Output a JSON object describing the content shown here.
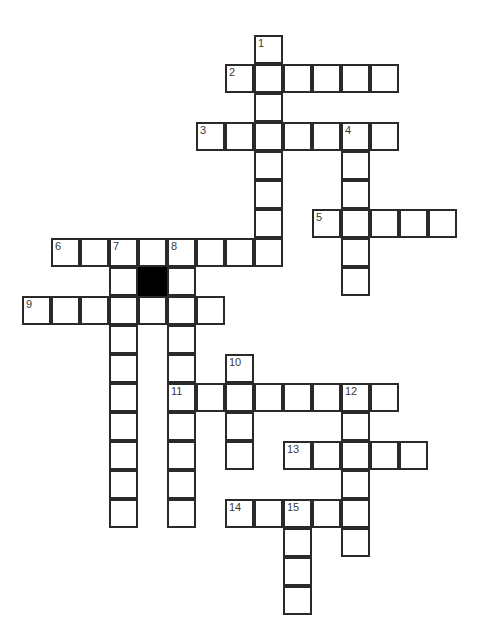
{
  "puzzle": {
    "type": "crossword-grid",
    "title": "Crossword Puzzle Grid",
    "width": 491,
    "height": 634,
    "cell_size": 29,
    "origin_x": 22,
    "origin_y": 35,
    "background_color": "#ffffff",
    "line_color": "#2a2a2a",
    "block_color": "#000000",
    "number_color": "#3a3a3a",
    "columns": 16,
    "rows": 20,
    "clue_numbers": [
      "1",
      "2",
      "3",
      "4",
      "5",
      "6",
      "7",
      "8",
      "9",
      "10",
      "11",
      "12",
      "13",
      "14",
      "15"
    ],
    "entries": [
      {
        "number": "1",
        "direction": "down",
        "col": 8,
        "row": 0,
        "length": 8
      },
      {
        "number": "2",
        "direction": "across",
        "col": 7,
        "row": 1,
        "length": 6
      },
      {
        "number": "3",
        "direction": "across",
        "col": 6,
        "row": 3,
        "length": 7
      },
      {
        "number": "4",
        "direction": "down",
        "col": 11,
        "row": 3,
        "length": 6
      },
      {
        "number": "5",
        "direction": "across",
        "col": 10,
        "row": 6,
        "length": 5
      },
      {
        "number": "6",
        "direction": "across",
        "col": 1,
        "row": 7,
        "length": 8
      },
      {
        "number": "7",
        "direction": "down",
        "col": 3,
        "row": 7,
        "length": 9
      },
      {
        "number": "8",
        "direction": "down",
        "col": 5,
        "row": 7,
        "length": 9
      },
      {
        "number": "9",
        "direction": "across",
        "col": 0,
        "row": 9,
        "length": 7
      },
      {
        "number": "10",
        "direction": "down",
        "col": 7,
        "row": 11,
        "length": 4
      },
      {
        "number": "11",
        "direction": "across",
        "col": 5,
        "row": 12,
        "length": 7
      },
      {
        "number": "12",
        "direction": "down",
        "col": 11,
        "row": 12,
        "length": 6
      },
      {
        "number": "13",
        "direction": "across",
        "col": 9,
        "row": 14,
        "length": 5
      },
      {
        "number": "14",
        "direction": "across",
        "col": 7,
        "row": 16,
        "length": 5
      },
      {
        "number": "15",
        "direction": "down",
        "col": 9,
        "row": 16,
        "length": 4
      }
    ],
    "blocks": [
      {
        "col": 4,
        "row": 8
      }
    ],
    "cells": [
      {
        "col": 8,
        "row": 0,
        "num": "1"
      },
      {
        "col": 7,
        "row": 1,
        "num": "2"
      },
      {
        "col": 8,
        "row": 1,
        "num": ""
      },
      {
        "col": 9,
        "row": 1,
        "num": ""
      },
      {
        "col": 10,
        "row": 1,
        "num": ""
      },
      {
        "col": 11,
        "row": 1,
        "num": ""
      },
      {
        "col": 12,
        "row": 1,
        "num": ""
      },
      {
        "col": 8,
        "row": 2,
        "num": ""
      },
      {
        "col": 6,
        "row": 3,
        "num": "3"
      },
      {
        "col": 7,
        "row": 3,
        "num": ""
      },
      {
        "col": 8,
        "row": 3,
        "num": ""
      },
      {
        "col": 9,
        "row": 3,
        "num": ""
      },
      {
        "col": 10,
        "row": 3,
        "num": ""
      },
      {
        "col": 11,
        "row": 3,
        "num": "4"
      },
      {
        "col": 12,
        "row": 3,
        "num": ""
      },
      {
        "col": 8,
        "row": 4,
        "num": ""
      },
      {
        "col": 11,
        "row": 4,
        "num": ""
      },
      {
        "col": 8,
        "row": 5,
        "num": ""
      },
      {
        "col": 11,
        "row": 5,
        "num": ""
      },
      {
        "col": 10,
        "row": 6,
        "num": "5"
      },
      {
        "col": 11,
        "row": 6,
        "num": ""
      },
      {
        "col": 12,
        "row": 6,
        "num": ""
      },
      {
        "col": 13,
        "row": 6,
        "num": ""
      },
      {
        "col": 14,
        "row": 6,
        "num": ""
      },
      {
        "col": 8,
        "row": 6,
        "num": ""
      },
      {
        "col": 1,
        "row": 7,
        "num": "6"
      },
      {
        "col": 2,
        "row": 7,
        "num": ""
      },
      {
        "col": 3,
        "row": 7,
        "num": "7"
      },
      {
        "col": 4,
        "row": 7,
        "num": ""
      },
      {
        "col": 5,
        "row": 7,
        "num": "8"
      },
      {
        "col": 6,
        "row": 7,
        "num": ""
      },
      {
        "col": 7,
        "row": 7,
        "num": ""
      },
      {
        "col": 8,
        "row": 7,
        "num": ""
      },
      {
        "col": 11,
        "row": 7,
        "num": ""
      },
      {
        "col": 3,
        "row": 8,
        "num": ""
      },
      {
        "col": 5,
        "row": 8,
        "num": ""
      },
      {
        "col": 11,
        "row": 8,
        "num": ""
      },
      {
        "col": 0,
        "row": 9,
        "num": "9"
      },
      {
        "col": 1,
        "row": 9,
        "num": ""
      },
      {
        "col": 2,
        "row": 9,
        "num": ""
      },
      {
        "col": 3,
        "row": 9,
        "num": ""
      },
      {
        "col": 4,
        "row": 9,
        "num": ""
      },
      {
        "col": 5,
        "row": 9,
        "num": ""
      },
      {
        "col": 6,
        "row": 9,
        "num": ""
      },
      {
        "col": 3,
        "row": 10,
        "num": ""
      },
      {
        "col": 5,
        "row": 10,
        "num": ""
      },
      {
        "col": 3,
        "row": 11,
        "num": ""
      },
      {
        "col": 5,
        "row": 11,
        "num": ""
      },
      {
        "col": 7,
        "row": 11,
        "num": "10"
      },
      {
        "col": 3,
        "row": 12,
        "num": ""
      },
      {
        "col": 5,
        "row": 12,
        "num": "11"
      },
      {
        "col": 6,
        "row": 12,
        "num": ""
      },
      {
        "col": 7,
        "row": 12,
        "num": ""
      },
      {
        "col": 8,
        "row": 12,
        "num": ""
      },
      {
        "col": 9,
        "row": 12,
        "num": ""
      },
      {
        "col": 10,
        "row": 12,
        "num": ""
      },
      {
        "col": 11,
        "row": 12,
        "num": "12"
      },
      {
        "col": 12,
        "row": 12,
        "num": ""
      },
      {
        "col": 3,
        "row": 13,
        "num": ""
      },
      {
        "col": 5,
        "row": 13,
        "num": ""
      },
      {
        "col": 7,
        "row": 13,
        "num": ""
      },
      {
        "col": 11,
        "row": 13,
        "num": ""
      },
      {
        "col": 3,
        "row": 14,
        "num": ""
      },
      {
        "col": 5,
        "row": 14,
        "num": ""
      },
      {
        "col": 7,
        "row": 14,
        "num": ""
      },
      {
        "col": 9,
        "row": 14,
        "num": "13"
      },
      {
        "col": 10,
        "row": 14,
        "num": ""
      },
      {
        "col": 11,
        "row": 14,
        "num": ""
      },
      {
        "col": 12,
        "row": 14,
        "num": ""
      },
      {
        "col": 13,
        "row": 14,
        "num": ""
      },
      {
        "col": 3,
        "row": 15,
        "num": ""
      },
      {
        "col": 5,
        "row": 15,
        "num": ""
      },
      {
        "col": 11,
        "row": 15,
        "num": ""
      },
      {
        "col": 7,
        "row": 16,
        "num": "14"
      },
      {
        "col": 8,
        "row": 16,
        "num": ""
      },
      {
        "col": 9,
        "row": 16,
        "num": "15"
      },
      {
        "col": 10,
        "row": 16,
        "num": ""
      },
      {
        "col": 11,
        "row": 16,
        "num": ""
      },
      {
        "col": 3,
        "row": 16,
        "num": ""
      },
      {
        "col": 5,
        "row": 16,
        "num": ""
      },
      {
        "col": 9,
        "row": 17,
        "num": ""
      },
      {
        "col": 11,
        "row": 17,
        "num": ""
      },
      {
        "col": 9,
        "row": 18,
        "num": ""
      },
      {
        "col": 9,
        "row": 19,
        "num": ""
      }
    ]
  }
}
